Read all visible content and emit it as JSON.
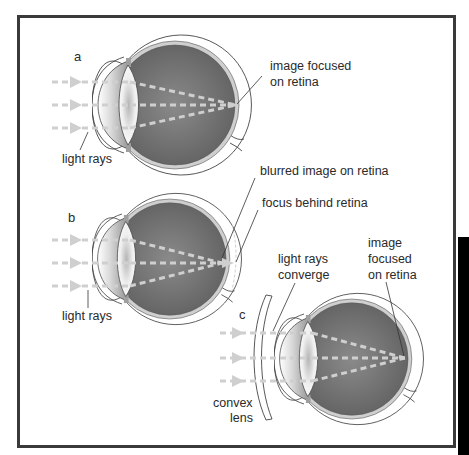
{
  "figure": {
    "colors": {
      "frame": "#3a3a3a",
      "background": "#ffffff",
      "vitreous": "#6e6e6e",
      "vitreous_center": "#8a8a8a",
      "light_rays": "#cfcfcf",
      "text": "#2a2a2a",
      "side_block": "#000000"
    },
    "panels": [
      {
        "id": "a",
        "letter": "a",
        "labels": {
          "rays": "light rays",
          "focus_line1": "image focused",
          "focus_line2": "on retina"
        }
      },
      {
        "id": "b",
        "letter": "b",
        "labels": {
          "rays": "light rays",
          "blur": "blurred image on retina",
          "focus_behind": "focus behind retina"
        }
      },
      {
        "id": "c",
        "letter": "c",
        "labels": {
          "converge_line1": "light rays",
          "converge_line2": "converge",
          "focus_line1": "image",
          "focus_line2": "focused",
          "focus_line3": "on retina",
          "lens_line1": "convex",
          "lens_line2": "lens"
        }
      }
    ]
  }
}
